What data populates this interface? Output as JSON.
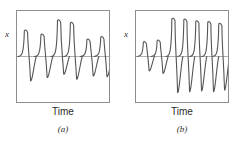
{
  "figure": {
    "background_color": "#ffffff",
    "frame_color": "#8e8e8e",
    "trace_color": "#555555",
    "baseline_color": "#8e8e8e"
  },
  "panels": [
    {
      "id": "a",
      "caption": "(a)",
      "y_axis_label": "x",
      "x_axis_label": "Time"
    },
    {
      "id": "b",
      "caption": "(b)",
      "y_axis_label": "x",
      "x_axis_label": "Time"
    }
  ],
  "chart_data": [
    {
      "type": "line",
      "title": "",
      "subtitle": "",
      "panel_id": "a",
      "caption": "(a)",
      "xlabel": "Time",
      "ylabel": "x",
      "grid": false,
      "legend": false,
      "axis_ticks": false,
      "baseline_y": 0,
      "xlim": [
        0,
        100
      ],
      "ylim": [
        -1,
        1
      ],
      "description": "Irregular spike train: six asymmetric spikes of varying amplitude, each with a fast rise, a rounded positive peak, and a decaying undershoot below the baseline.",
      "spikes": [
        {
          "index": 1,
          "x": 8,
          "peak": 0.62,
          "trough": -0.58,
          "width": 13
        },
        {
          "index": 2,
          "x": 26,
          "peak": 0.52,
          "trough": -0.5,
          "width": 13
        },
        {
          "index": 3,
          "x": 44,
          "peak": 0.86,
          "trough": -0.42,
          "width": 13
        },
        {
          "index": 4,
          "x": 58,
          "peak": 0.8,
          "trough": -0.54,
          "width": 13
        },
        {
          "index": 5,
          "x": 76,
          "peak": 0.4,
          "trough": -0.46,
          "width": 13
        },
        {
          "index": 6,
          "x": 91,
          "peak": 0.46,
          "trough": -0.48,
          "width": 13
        }
      ]
    },
    {
      "type": "line",
      "title": "",
      "subtitle": "",
      "panel_id": "b",
      "caption": "(b)",
      "xlabel": "Time",
      "ylabel": "x",
      "grid": false,
      "legend": false,
      "axis_ticks": false,
      "baseline_y": 0,
      "xlim": [
        0,
        100
      ],
      "ylim": [
        -1,
        1
      ],
      "description": "Spike train beginning with two small-amplitude spikes, followed by five large, regular, high-amplitude spikes with deep undershoots.",
      "spikes": [
        {
          "index": 1,
          "x": 8,
          "peak": 0.34,
          "trough": -0.34,
          "width": 12
        },
        {
          "index": 2,
          "x": 23,
          "peak": 0.38,
          "trough": -0.4,
          "width": 12
        },
        {
          "index": 3,
          "x": 39,
          "peak": 0.9,
          "trough": -0.86,
          "width": 12
        },
        {
          "index": 4,
          "x": 52,
          "peak": 0.88,
          "trough": -0.84,
          "width": 12
        },
        {
          "index": 5,
          "x": 65,
          "peak": 0.84,
          "trough": -0.82,
          "width": 12
        },
        {
          "index": 6,
          "x": 78,
          "peak": 0.82,
          "trough": -0.84,
          "width": 12
        },
        {
          "index": 7,
          "x": 90,
          "peak": 0.78,
          "trough": -0.8,
          "width": 12
        }
      ]
    }
  ]
}
